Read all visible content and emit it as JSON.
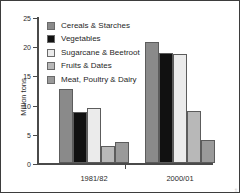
{
  "chart_data": {
    "type": "bar",
    "title": "",
    "xlabel": "",
    "ylabel": "Million tons",
    "ylim": [
      0,
      25
    ],
    "yticks": [
      0,
      5,
      10,
      15,
      20,
      25
    ],
    "ytick_labels": [
      "0",
      "5",
      "10",
      "15",
      "20",
      "25"
    ],
    "grid": false,
    "legend_position": "top-left",
    "categories": [
      "1981/82",
      "2000/01"
    ],
    "series": [
      {
        "name": "Cereals & Starches",
        "color": "#8a8a8a",
        "values": [
          12.7,
          20.7
        ]
      },
      {
        "name": "Vegetables",
        "color": "#111111",
        "values": [
          8.8,
          18.9
        ]
      },
      {
        "name": "Sugarcane & Beetroot",
        "color": "#ebebeb",
        "values": [
          9.5,
          18.7
        ]
      },
      {
        "name": "Fruits & Dates",
        "color": "#b8b8b8",
        "values": [
          2.9,
          8.9
        ]
      },
      {
        "name": "Meat, Poultry & Dairy",
        "color": "#9a9a9a",
        "values": [
          3.6,
          3.9
        ]
      }
    ]
  },
  "credit": {
    "text": "Source: State Information Service"
  }
}
